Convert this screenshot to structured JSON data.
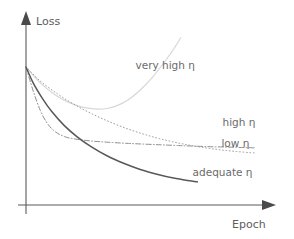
{
  "chart_data": {
    "type": "line",
    "title": "",
    "xlabel": "Epoch",
    "ylabel": "Loss",
    "grid": false,
    "legend_position": "inline-annotations",
    "axis_style": "arrow-axes-no-ticks",
    "xlim": [
      0,
      1
    ],
    "ylim": [
      0,
      1
    ],
    "note": "Schematic learning-rate comparison: loss vs epoch for four learning rates. No numeric tick labels are shown on either axis.",
    "series": [
      {
        "name": "very high η",
        "label": "very high η",
        "style": "solid",
        "color": "#d7d7d7",
        "width": 1.2,
        "shape": "dips-then-diverges",
        "label_x": 0.46,
        "label_y": 0.77,
        "points": [
          [
            0.0,
            0.78
          ],
          [
            0.06,
            0.69
          ],
          [
            0.12,
            0.625
          ],
          [
            0.18,
            0.58
          ],
          [
            0.24,
            0.552
          ],
          [
            0.3,
            0.542
          ],
          [
            0.34,
            0.545
          ],
          [
            0.38,
            0.56
          ],
          [
            0.43,
            0.595
          ],
          [
            0.48,
            0.65
          ],
          [
            0.53,
            0.72
          ],
          [
            0.58,
            0.805
          ],
          [
            0.62,
            0.88
          ],
          [
            0.65,
            0.945
          ]
        ]
      },
      {
        "name": "high η",
        "label": "high η",
        "style": "dash-dot",
        "color": "#8f8f8f",
        "width": 1.0,
        "shape": "fast-drop-then-plateau-high",
        "label_x": 0.895,
        "label_y": 0.445,
        "points": [
          [
            0.0,
            0.78
          ],
          [
            0.03,
            0.645
          ],
          [
            0.06,
            0.535
          ],
          [
            0.09,
            0.46
          ],
          [
            0.125,
            0.412
          ],
          [
            0.165,
            0.385
          ],
          [
            0.21,
            0.372
          ],
          [
            0.27,
            0.362
          ],
          [
            0.34,
            0.355
          ],
          [
            0.43,
            0.348
          ],
          [
            0.53,
            0.342
          ],
          [
            0.64,
            0.336
          ],
          [
            0.76,
            0.33
          ],
          [
            0.88,
            0.326
          ],
          [
            0.96,
            0.323
          ]
        ]
      },
      {
        "name": "low η",
        "label": "low η",
        "style": "dotted",
        "color": "#9a9a9a",
        "width": 1.0,
        "shape": "slow-steady-decline",
        "label_x": 0.88,
        "label_y": 0.33,
        "points": [
          [
            0.0,
            0.78
          ],
          [
            0.06,
            0.7
          ],
          [
            0.13,
            0.63
          ],
          [
            0.2,
            0.57
          ],
          [
            0.28,
            0.513
          ],
          [
            0.36,
            0.465
          ],
          [
            0.44,
            0.424
          ],
          [
            0.52,
            0.39
          ],
          [
            0.6,
            0.362
          ],
          [
            0.68,
            0.34
          ],
          [
            0.76,
            0.322
          ],
          [
            0.84,
            0.308
          ],
          [
            0.92,
            0.298
          ],
          [
            0.96,
            0.294
          ]
        ]
      },
      {
        "name": "adequate η",
        "label": "adequate η",
        "style": "solid",
        "color": "#585858",
        "width": 1.5,
        "shape": "smooth-convergence-to-low-loss",
        "label_x": 0.7,
        "label_y": 0.165,
        "points": [
          [
            0.0,
            0.78
          ],
          [
            0.03,
            0.69
          ],
          [
            0.07,
            0.6
          ],
          [
            0.11,
            0.525
          ],
          [
            0.16,
            0.45
          ],
          [
            0.215,
            0.385
          ],
          [
            0.275,
            0.328
          ],
          [
            0.34,
            0.278
          ],
          [
            0.41,
            0.236
          ],
          [
            0.48,
            0.201
          ],
          [
            0.55,
            0.174
          ],
          [
            0.62,
            0.152
          ],
          [
            0.68,
            0.138
          ],
          [
            0.72,
            0.131
          ]
        ]
      }
    ]
  },
  "axes": {
    "y_label": "Loss",
    "x_label": "Epoch"
  }
}
